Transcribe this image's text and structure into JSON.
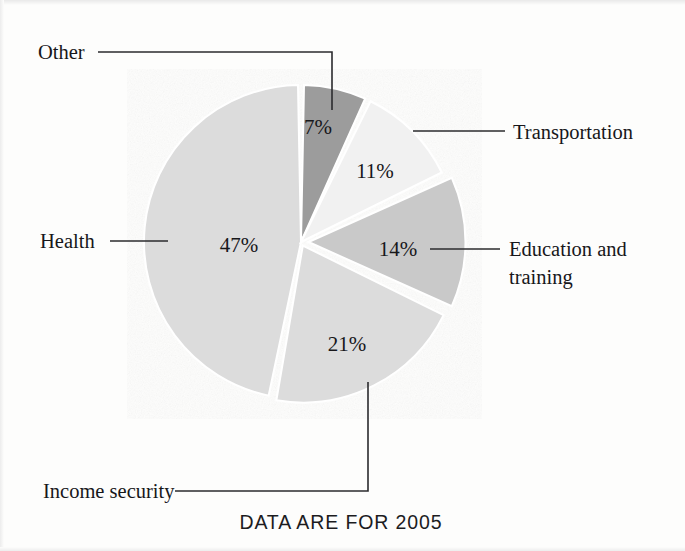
{
  "figure": {
    "caption": "DATA ARE FOR 2005",
    "background_color": "#fdfdfc"
  },
  "chart_data": {
    "type": "pie",
    "title": "",
    "subtitle": "",
    "caption": "DATA ARE FOR 2005",
    "xlabel": "",
    "ylabel": "",
    "grid": false,
    "legend_position": "callout-labels",
    "units": "percent",
    "total": 100,
    "categories": [
      "Other",
      "Transportation",
      "Education and training",
      "Income security",
      "Health"
    ],
    "values": [
      7,
      11,
      14,
      21,
      47
    ],
    "slices": [
      {
        "label": "Other",
        "value": 7,
        "value_text": "7%",
        "color": "#9c9c9c",
        "callout_side": "top-left"
      },
      {
        "label": "Transportation",
        "value": 11,
        "value_text": "11%",
        "color": "#f1f1f1",
        "callout_side": "right"
      },
      {
        "label": "Education and training",
        "value": 14,
        "value_text": "14%",
        "color": "#c9c9c9",
        "callout_side": "right"
      },
      {
        "label": "Income security",
        "value": 21,
        "value_text": "21%",
        "color": "#dcdcdc",
        "callout_side": "bottom-left"
      },
      {
        "label": "Health",
        "value": 47,
        "value_text": "47%",
        "color": "#dcdcdc",
        "callout_side": "left"
      }
    ]
  },
  "callouts": {
    "other": "Other",
    "transportation": "Transportation",
    "education_line1": "Education and",
    "education_line2": "training",
    "health": "Health",
    "income_security": "Income security"
  },
  "values": {
    "other": "7%",
    "transportation": "11%",
    "education": "14%",
    "income_security": "21%",
    "health": "47%"
  },
  "colors": {
    "slice_other": "#9c9c9c",
    "slice_transportation": "#f1f1f1",
    "slice_education": "#c9c9c9",
    "slice_income_security": "#dcdcdc",
    "slice_health": "#dcdcdc",
    "separator": "#ffffff",
    "leader_line": "#2b2b2e",
    "text": "#17171a"
  }
}
